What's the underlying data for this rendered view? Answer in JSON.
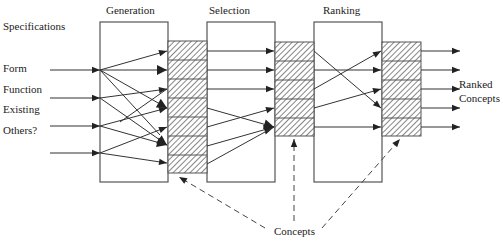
{
  "diagram": {
    "stages": [
      {
        "id": "generation",
        "label": "Generation"
      },
      {
        "id": "selection",
        "label": "Selection"
      },
      {
        "id": "ranking",
        "label": "Ranking"
      }
    ],
    "inputs": {
      "heading": "Specifications",
      "items": [
        "Form",
        "Function",
        "Existing",
        "Others?"
      ]
    },
    "output_label_line1": "Ranked",
    "output_label_line2": "Concepts",
    "concepts_label": "Concepts",
    "colors": {
      "line": "#333333",
      "box_border": "#555555",
      "hatch": "#444444",
      "background": "#ffffff"
    },
    "concept_columns": [
      {
        "after_stage": "generation",
        "cells": 7
      },
      {
        "after_stage": "selection",
        "cells": 5
      },
      {
        "after_stage": "ranking",
        "cells": 5
      }
    ]
  }
}
